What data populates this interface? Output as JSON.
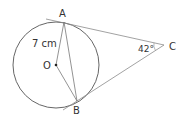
{
  "diagram": {
    "type": "geometry",
    "labels": {
      "point_a": "A",
      "point_b": "B",
      "point_c": "C",
      "center": "O",
      "radius_length": "7 cm",
      "angle_c": "42°"
    },
    "points": {
      "O": [
        56,
        65
      ],
      "A": [
        64,
        22
      ],
      "B": [
        77,
        101
      ],
      "C": [
        164,
        45
      ]
    },
    "circle": {
      "cx": 56,
      "cy": 65,
      "r": 43
    },
    "colors": {
      "circle_stroke": "#555555",
      "line_stroke": "#888888",
      "text": "#333333"
    }
  }
}
